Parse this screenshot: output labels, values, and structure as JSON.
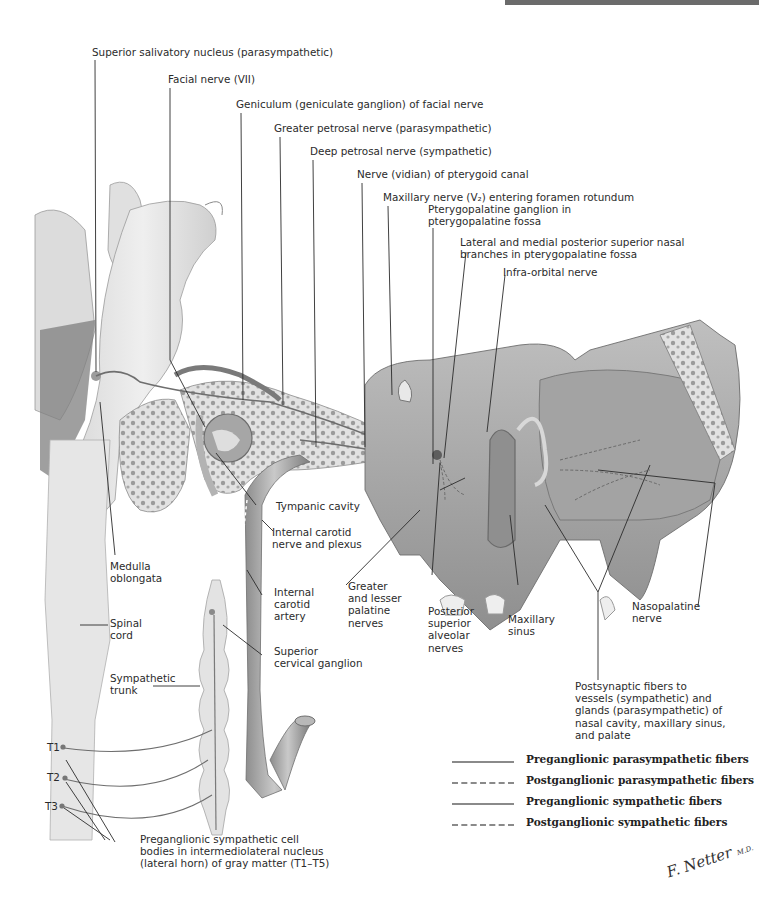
{
  "header": {
    "bar_color": "#6b6b6b",
    "text": "See also Plates ..."
  },
  "labels": {
    "superior_salivatory_nucleus": "Superior salivatory nucleus (parasympathetic)",
    "facial_nerve": "Facial nerve (VII)",
    "geniculum": "Geniculum (geniculate ganglion) of facial nerve",
    "greater_petrosal": "Greater petrosal nerve (parasympathetic)",
    "deep_petrosal": "Deep petrosal nerve (sympathetic)",
    "vidian_nerve": "Nerve (vidian) of pterygoid canal",
    "maxillary_nerve": "Maxillary nerve (V₂) entering foramen rotundum",
    "pterygopalatine_ganglion": "Pterygopalatine ganglion in\npterygopalatine fossa",
    "nasal_branches": "Lateral and medial posterior superior nasal\nbranches in pterygopalatine fossa",
    "infraorbital": "Infra-orbital nerve",
    "tympanic_cavity": "Tympanic cavity",
    "internal_carotid_nerve": "Internal carotid\nnerve and plexus",
    "medulla": "Medulla\noblongata",
    "internal_carotid_artery": "Internal\ncarotid\nartery",
    "greater_lesser_palatine": "Greater\nand lesser\npalatine\nnerves",
    "posterior_superior_alveolar": "Posterior\nsuperior\nalveolar\nnerves",
    "maxillary_sinus": "Maxillary\nsinus",
    "nasopalatine": "Nasopalatine\nnerve",
    "spinal_cord": "Spinal\ncord",
    "superior_cervical_ganglion": "Superior\ncervical ganglion",
    "sympathetic_trunk": "Sympathetic\ntrunk",
    "postsynaptic_fibers": "Postsynaptic fibers to\nvessels (sympathetic) and\nglands (parasympathetic) of\nnasal cavity, maxillary sinus,\nand palate",
    "t1": "T1",
    "t2": "T2",
    "t3": "T3",
    "preganglionic_cell_bodies": "Preganglionic sympathetic cell\nbodies in intermediolateral nucleus\n(lateral horn) of gray matter (T1–T5)"
  },
  "legend": {
    "items": [
      {
        "label": "Preganglionic parasympathetic fibers",
        "style": "solid"
      },
      {
        "label": "Postganglionic parasympathetic fibers",
        "style": "dashed"
      },
      {
        "label": "Preganglionic sympathetic fibers",
        "style": "solid"
      },
      {
        "label": "Postganglionic sympathetic fibers",
        "style": "dashed"
      }
    ]
  },
  "signature": {
    "text": "F. Netter",
    "suffix": "M.D."
  },
  "colors": {
    "tissue_light": "#e4e4e4",
    "tissue_mid": "#bdbdbd",
    "tissue_dark": "#7a7a7a",
    "leader_line": "#2b2b2b",
    "fiber": "#6e6e6e"
  }
}
